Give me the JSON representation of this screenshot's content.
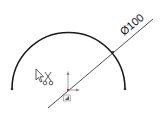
{
  "sketch": {
    "arc": {
      "center": [
        68.5,
        89
      ],
      "radius": 57,
      "stroke": "#1a1a1a"
    },
    "endpoints": [
      [
        12,
        89
      ],
      [
        125,
        89
      ]
    ],
    "dimension": {
      "label": "Ø100",
      "line_start": [
        48,
        108
      ],
      "line_end": [
        153,
        20
      ],
      "text_x": 128,
      "text_y": 32,
      "angle": -40
    },
    "origin": {
      "x": 68,
      "y": 90
    },
    "cursor": {
      "icon": "select-arrow-cursor",
      "badge": "scissors-trim-icon"
    }
  }
}
